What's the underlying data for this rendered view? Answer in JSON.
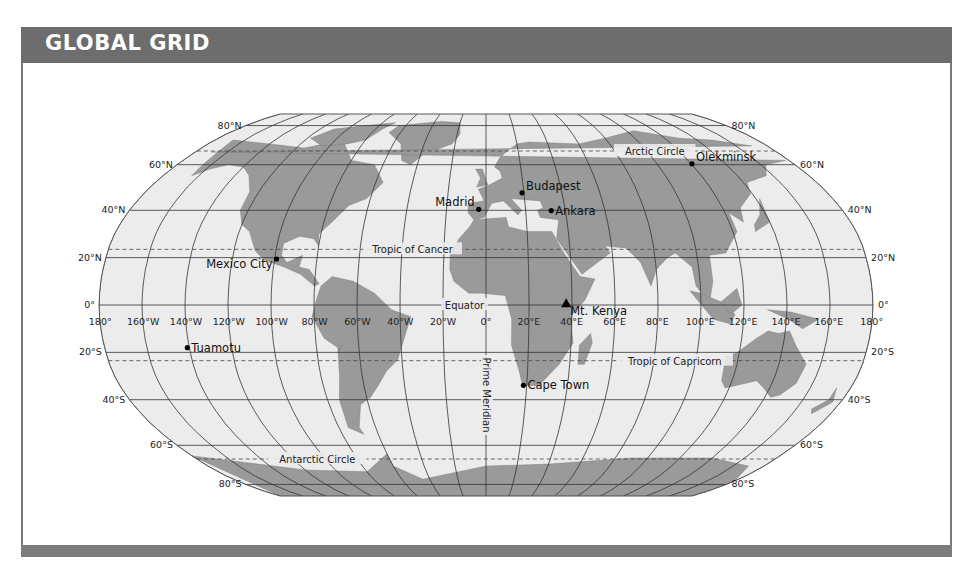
{
  "header": {
    "title": "GLOBAL GRID"
  },
  "map": {
    "projection": "robinson",
    "center_x": 486,
    "center_y": 305,
    "x_scale": 387,
    "y_scale": 191,
    "colors": {
      "ocean": "#ececec",
      "land": "#9a9a9a",
      "grid": "#333333",
      "header": "#6d6d6d"
    },
    "latitude_labels": [
      {
        "lat": 80,
        "text": "80°N"
      },
      {
        "lat": 60,
        "text": "60°N"
      },
      {
        "lat": 40,
        "text": "40°N"
      },
      {
        "lat": 20,
        "text": "20°N"
      },
      {
        "lat": 0,
        "text": "0°"
      },
      {
        "lat": -20,
        "text": "20°S"
      },
      {
        "lat": -40,
        "text": "40°S"
      },
      {
        "lat": -60,
        "text": "60°S"
      },
      {
        "lat": -80,
        "text": "80°S"
      }
    ],
    "longitude_labels": [
      {
        "lon": -180,
        "text": "180°"
      },
      {
        "lon": -160,
        "text": "160°W"
      },
      {
        "lon": -140,
        "text": "140°W"
      },
      {
        "lon": -120,
        "text": "120°W"
      },
      {
        "lon": -100,
        "text": "100°W"
      },
      {
        "lon": -80,
        "text": "80°W"
      },
      {
        "lon": -60,
        "text": "60°W"
      },
      {
        "lon": -40,
        "text": "40°W"
      },
      {
        "lon": -20,
        "text": "20°W"
      },
      {
        "lon": 0,
        "text": "0°"
      },
      {
        "lon": 20,
        "text": "20°E"
      },
      {
        "lon": 40,
        "text": "40°E"
      },
      {
        "lon": 60,
        "text": "60°E"
      },
      {
        "lon": 80,
        "text": "80°E"
      },
      {
        "lon": 100,
        "text": "100°E"
      },
      {
        "lon": 120,
        "text": "120°E"
      },
      {
        "lon": 140,
        "text": "140°E"
      },
      {
        "lon": 160,
        "text": "160°E"
      },
      {
        "lon": 180,
        "text": "180°"
      }
    ],
    "special_lines": [
      {
        "name": "Arctic Circle",
        "lat": 66.5,
        "label_lon": 105
      },
      {
        "name": "Tropic of Cancer",
        "lat": 23.5,
        "label_lon": -35
      },
      {
        "name": "Equator",
        "lat": 0,
        "label_lon": -10
      },
      {
        "name": "Tropic of Capricorn",
        "lat": -23.5,
        "label_lon": 90
      },
      {
        "name": "Antarctic Circle",
        "lat": -66.5,
        "label_lon": -105
      }
    ],
    "prime_meridian_label": "Prime Meridian",
    "places": [
      {
        "name": "Olekminsk",
        "lat": 60.4,
        "lon": 120.4,
        "marker": "dot"
      },
      {
        "name": "Budapest",
        "lat": 47.5,
        "lon": 19.0,
        "marker": "dot"
      },
      {
        "name": "Madrid",
        "lat": 40.4,
        "lon": -3.7,
        "marker": "dot",
        "align": "left"
      },
      {
        "name": "Ankara",
        "lat": 39.9,
        "lon": 32.9,
        "marker": "dot"
      },
      {
        "name": "Mexico City",
        "lat": 19.4,
        "lon": -99.1,
        "marker": "dot",
        "align": "left"
      },
      {
        "name": "Mt. Kenya",
        "lat": -0.15,
        "lon": 37.3,
        "marker": "triangle"
      },
      {
        "name": "Tuamotu",
        "lat": -18,
        "lon": -141,
        "marker": "dot"
      },
      {
        "name": "Cape Town",
        "lat": -33.9,
        "lon": 18.4,
        "marker": "dot"
      }
    ]
  }
}
